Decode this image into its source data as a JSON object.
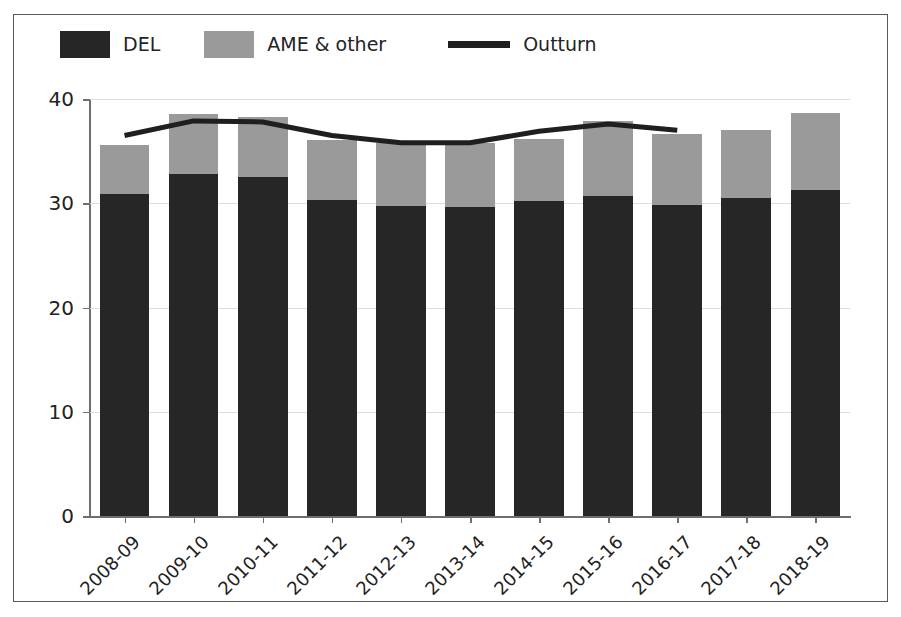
{
  "figure": {
    "border_color": "#5a5a5a",
    "background": "#ffffff"
  },
  "legend": {
    "entries": [
      {
        "label": "DEL",
        "type": "swatch",
        "color": "#262626",
        "icon": "filled-square-icon"
      },
      {
        "label": "AME & other",
        "type": "swatch",
        "color": "#9a9a9a",
        "icon": "filled-square-icon"
      },
      {
        "label": "Outturn",
        "type": "line",
        "color": "#1f1f1f",
        "icon": "line-segment-icon"
      }
    ]
  },
  "chart_data": {
    "type": "bar",
    "title": "",
    "xlabel": "",
    "ylabel": "Expenditure real / £ billion (2016-17 prices)",
    "ylim": [
      0,
      40
    ],
    "yticks": [
      0,
      10,
      20,
      30,
      40
    ],
    "ytick_labels": [
      "0",
      "10",
      "20",
      "30",
      "40"
    ],
    "grid": true,
    "legend_position": "top-left",
    "stacked": true,
    "categories": [
      "2008-09",
      "2009-10",
      "2010-11",
      "2011-12",
      "2012-13",
      "2013-14",
      "2014-15",
      "2015-16",
      "2016-17",
      "2017-18",
      "2018-19"
    ],
    "series": [
      {
        "name": "DEL",
        "color": "#262626",
        "values": [
          30.9,
          32.8,
          32.5,
          30.3,
          29.7,
          29.6,
          30.2,
          30.7,
          29.8,
          30.5,
          31.3
        ]
      },
      {
        "name": "AME & other",
        "color": "#9a9a9a",
        "values": [
          4.7,
          5.8,
          5.8,
          5.8,
          6.1,
          6.2,
          6.0,
          7.2,
          6.8,
          6.5,
          7.4
        ]
      }
    ],
    "totals": [
      35.6,
      38.6,
      38.3,
      36.1,
      35.8,
      35.8,
      36.2,
      37.9,
      36.6,
      37.0,
      38.7
    ],
    "overlay": {
      "name": "Outturn",
      "type": "line",
      "color": "#1f1f1f",
      "categories": [
        "2008-09",
        "2009-10",
        "2010-11",
        "2011-12",
        "2012-13",
        "2013-14",
        "2014-15",
        "2015-16",
        "2016-17"
      ],
      "values": [
        36.5,
        37.9,
        37.8,
        36.5,
        35.8,
        35.8,
        36.9,
        37.6,
        37.0
      ]
    }
  }
}
